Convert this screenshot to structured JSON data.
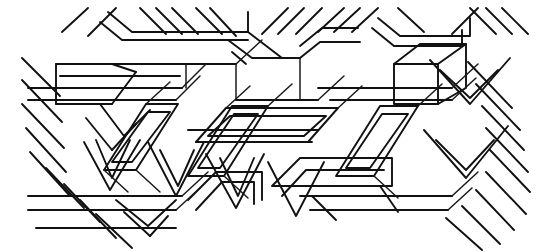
{
  "figure": {
    "type": "line-art",
    "width": 542,
    "height": 252,
    "background_color": "#ffffff",
    "ink_color": "#111111",
    "stroke_width": 1.9,
    "angles_degrees": [
      0,
      30,
      -30,
      60,
      -60,
      90
    ],
    "motifs": [
      "nested parallelogram",
      "chevron",
      "isometric cube corner",
      "parallel diagonal hatch bands",
      "long horizontal rails"
    ]
  },
  "geometry": {
    "top_hatch": [
      "M 62 32 L 88 8",
      "M 88 36 L 116 8",
      "M 140 8 L 166 34",
      "M 156 8 L 182 34",
      "M 172 8 L 198 34",
      "M 196 8 L 222 34",
      "M 210 8 L 236 36",
      "M 262 34 L 288 8",
      "M 278 34 L 304 8",
      "M 296 34 L 322 8",
      "M 318 32 L 344 8",
      "M 334 32 L 360 8",
      "M 352 32 L 378 8",
      "M 398 8 L 424 32",
      "M 452 34 L 478 8",
      "M 470 8 L 496 34",
      "M 486 8 L 512 34",
      "M 502 8 L 528 34"
    ],
    "top_bracket_left": [
      "M 100 22 L 122 40 L 248 40",
      "M 108 12 L 132 32 L 248 32 L 248 12",
      "M 248 32 L 282 58 L 300 58"
    ],
    "top_bracket_mid": [
      "M 228 40 L 252 58 L 300 58",
      "M 232 52 L 246 64",
      "M 300 46 L 322 28 L 358 28",
      "M 300 58 L 320 42 L 360 42"
    ],
    "top_bracket_right": [
      "M 378 18 L 400 36 L 470 36 L 470 18",
      "M 372 28 L 394 46 L 462 46 L 462 30"
    ],
    "long_rails": [
      "M 28 88 L 182 88",
      "M 28 100 L 176 100",
      "M 56 64 L 186 64",
      "M 60 76 L 180 76",
      "M 186 64 L 236 64",
      "M 236 100 L 318 100",
      "M 318 88 L 452 88",
      "M 330 100 L 452 100",
      "M 28 196 L 182 196",
      "M 28 210 L 176 210",
      "M 36 228 L 176 228",
      "M 300 196 L 452 196",
      "M 310 210 L 448 210",
      "M 188 130 L 318 130",
      "M 196 142 L 312 142"
    ],
    "left_block": [
      "M 56 64 L 56 104",
      "M 56 104 L 112 104",
      "M 112 104 L 136 72",
      "M 136 72 L 112 64",
      "M 100 104 L 124 136 L 150 110",
      "M 86 118 L 112 150",
      "M 112 150 L 136 124"
    ],
    "left_hatch": [
      "M 22 58 L 60 96",
      "M 22 80 L 62 122",
      "M 22 104 L 64 148",
      "M 26 128 L 66 172",
      "M 30 152 L 70 196",
      "M 46 168 L 84 208",
      "M 64 184 L 100 222",
      "M 80 200 L 116 238",
      "M 96 214 L 132 248"
    ],
    "parallelogram_a": [
      "M 104 170 L 146 104 L 178 104 L 136 170 Z",
      "M 112 162 L 148 112 L 170 112 L 132 162 Z"
    ],
    "parallelogram_b": [
      "M 188 176 L 232 106 L 268 106 L 224 176 Z",
      "M 198 168 L 234 114 L 258 114 L 220 168 Z"
    ],
    "parallelogram_center": [
      "M 196 142 L 226 108 L 338 108 L 308 142 Z",
      "M 208 136 L 230 116 L 326 116 L 304 136 Z"
    ],
    "parallelogram_c": [
      "M 336 176 L 380 106 L 418 106 L 374 176 Z",
      "M 346 168 L 382 114 L 408 114 L 370 168 Z"
    ],
    "cube_right": [
      "M 394 64 L 420 44 L 466 44 L 466 88 L 438 104 L 394 104 Z",
      "M 394 64 L 438 64 L 438 104",
      "M 438 64 L 466 44"
    ],
    "chevrons_lower_left": [
      "M 84 142 L 110 190 L 140 140",
      "M 96 140 L 112 178 L 130 140",
      "M 148 142 L 176 196 L 204 142",
      "M 160 150 L 178 186 L 194 150"
    ],
    "chevrons_lower_mid": [
      "M 206 154 L 236 208 L 264 154",
      "M 220 158 L 238 196 L 254 158",
      "M 268 162 L 296 216 L 324 162"
    ],
    "bracket_lower_left": [
      "M 116 200 L 148 226 L 176 200",
      "M 124 212 L 150 236",
      "M 150 236 L 168 216"
    ],
    "bracket_lower_mid": [
      "M 188 200 L 216 172 L 262 172 L 262 200",
      "M 196 210 L 222 182 L 254 182 L 254 204"
    ],
    "lower_center_shapes": [
      "M 272 186 L 300 158 L 392 158 L 392 186 Z",
      "M 282 196 L 306 170 L 384 170",
      "M 312 196 L 336 220",
      "M 380 186 L 398 212"
    ],
    "right_hatch": [
      "M 468 62 L 512 108",
      "M 476 84 L 520 130",
      "M 482 106 L 524 150",
      "M 486 128 L 528 172",
      "M 490 150 L 530 192",
      "M 486 172 L 526 214",
      "M 476 190 L 514 230",
      "M 462 206 L 500 244",
      "M 446 218 L 482 250"
    ],
    "right_chevrons": [
      "M 430 60 L 470 104 L 510 58",
      "M 440 70 L 470 98 L 498 70",
      "M 424 130 L 466 178 L 508 126",
      "M 436 140 L 466 170 L 494 140"
    ],
    "misc_connectors": [
      "M 236 64 L 262 40",
      "M 182 88 L 206 64",
      "M 176 100 L 200 76",
      "M 318 100 L 344 76",
      "M 452 88 L 478 64",
      "M 452 100 L 476 78",
      "M 182 196 L 208 172",
      "M 176 210 L 200 188",
      "M 452 196 L 478 172",
      "M 448 210 L 472 188",
      "M 300 58 L 300 100",
      "M 186 64 L 186 88",
      "M 236 64 L 236 100",
      "M 338 108 L 362 86",
      "M 226 108 L 250 86",
      "M 268 106 L 292 84",
      "M 418 106 L 442 84",
      "M 146 104 L 170 82",
      "M 104 170 L 128 192",
      "M 224 176 L 248 198",
      "M 374 176 L 398 198",
      "M 136 170 L 160 192"
    ]
  },
  "labels": {
    "caption": ""
  }
}
